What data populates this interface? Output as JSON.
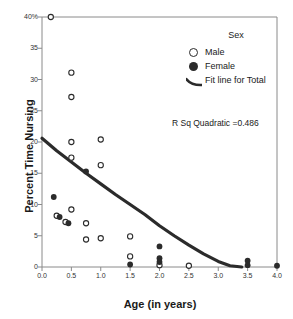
{
  "chart_data": {
    "type": "scatter",
    "title": "",
    "xlabel": "Age (in years)",
    "ylabel": "Percent Time Nursing",
    "xlim": [
      0.0,
      4.0
    ],
    "ylim": [
      0,
      40
    ],
    "xticks": [
      "0.0",
      "0.5",
      "1.0",
      "1.5",
      "2.0",
      "2.5",
      "3.0",
      "3.5",
      "4.0"
    ],
    "xtick_values": [
      0.0,
      0.5,
      1.0,
      1.5,
      2.0,
      2.5,
      3.0,
      3.5,
      4.0
    ],
    "yticks": [
      "0",
      "5",
      "10",
      "15",
      "20",
      "25",
      "30",
      "35",
      "40%"
    ],
    "ytick_values": [
      0,
      5,
      10,
      15,
      20,
      25,
      30,
      35,
      40
    ],
    "grid": false,
    "legend_position": "top-right",
    "annotation": "R Sq Quadratic =0.486",
    "series": [
      {
        "name": "Male",
        "marker": "open-circle",
        "color": "#2b2b2b",
        "points": [
          [
            0.15,
            40.0
          ],
          [
            0.5,
            31.1
          ],
          [
            0.5,
            27.2
          ],
          [
            0.5,
            20.0
          ],
          [
            1.0,
            20.4
          ],
          [
            0.5,
            17.5
          ],
          [
            1.0,
            16.3
          ],
          [
            0.5,
            9.2
          ],
          [
            0.25,
            8.2
          ],
          [
            0.4,
            7.2
          ],
          [
            0.75,
            7.0
          ],
          [
            0.75,
            4.4
          ],
          [
            1.5,
            4.9
          ],
          [
            1.0,
            4.6
          ],
          [
            1.5,
            1.7
          ],
          [
            2.0,
            0.3
          ],
          [
            2.5,
            0.2
          ]
        ]
      },
      {
        "name": "Female",
        "marker": "filled-circle",
        "color": "#2b2b2b",
        "points": [
          [
            0.75,
            15.3
          ],
          [
            0.2,
            11.2
          ],
          [
            0.3,
            8.0
          ],
          [
            0.45,
            7.0
          ],
          [
            2.0,
            3.3
          ],
          [
            2.0,
            1.4
          ],
          [
            1.5,
            0.4
          ],
          [
            2.0,
            0.8
          ],
          [
            3.5,
            1.0
          ],
          [
            3.5,
            0.3
          ],
          [
            4.0,
            0.2
          ]
        ]
      }
    ],
    "fit_line": {
      "name": "Fit line for Total",
      "type": "quadratic",
      "color": "#2b2b2b",
      "r_squared": 0.486,
      "points": [
        [
          0.0,
          20.6
        ],
        [
          0.25,
          18.6
        ],
        [
          0.5,
          16.8
        ],
        [
          0.75,
          15.0
        ],
        [
          1.0,
          13.3
        ],
        [
          1.25,
          11.6
        ],
        [
          1.5,
          10.0
        ],
        [
          1.75,
          8.4
        ],
        [
          2.0,
          6.6
        ],
        [
          2.25,
          5.0
        ],
        [
          2.5,
          3.5
        ],
        [
          2.75,
          2.1
        ],
        [
          3.0,
          0.9
        ],
        [
          3.2,
          0.2
        ],
        [
          3.4,
          0.0
        ]
      ]
    }
  },
  "legend": {
    "title": "Sex",
    "entries": [
      {
        "label": "Male",
        "marker": "open-circle"
      },
      {
        "label": "Female",
        "marker": "filled-circle"
      },
      {
        "label": "Fit line for Total",
        "marker": "line"
      }
    ]
  },
  "axes": {
    "x_title": "Age (in years)",
    "y_title": "Percent Time Nursing"
  },
  "annotation": {
    "text": "R Sq Quadratic =0.486"
  }
}
